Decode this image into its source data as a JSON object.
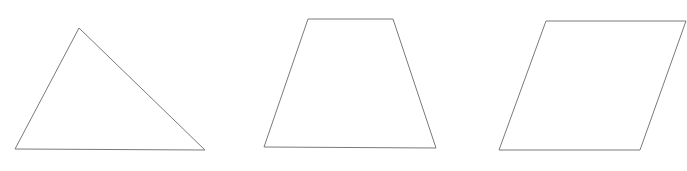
{
  "figure": {
    "background_color": "#ffffff",
    "stroke_color": "#7a7a7a",
    "fill_color": "#ffffff",
    "stroke_width": 1,
    "width": 687,
    "height": 171,
    "shapes": [
      {
        "name": "triangle",
        "label": "triangle",
        "vertex_count": 3,
        "points": "79,28 205,150 15,149",
        "vertices": [
          {
            "x": 79,
            "y": 28
          },
          {
            "x": 205,
            "y": 150
          },
          {
            "x": 15,
            "y": 149
          }
        ]
      },
      {
        "name": "trapezoid",
        "label": "trapezoid",
        "vertex_count": 4,
        "points": "308,19 393,19 436,148 264,147",
        "vertices": [
          {
            "x": 308,
            "y": 19
          },
          {
            "x": 393,
            "y": 19
          },
          {
            "x": 436,
            "y": 148
          },
          {
            "x": 264,
            "y": 147
          }
        ]
      },
      {
        "name": "parallelogram",
        "label": "parallelogram",
        "vertex_count": 4,
        "points": "546,21 686,21 640,150 499,150",
        "vertices": [
          {
            "x": 546,
            "y": 21
          },
          {
            "x": 686,
            "y": 21
          },
          {
            "x": 640,
            "y": 150
          },
          {
            "x": 499,
            "y": 150
          }
        ]
      }
    ]
  }
}
